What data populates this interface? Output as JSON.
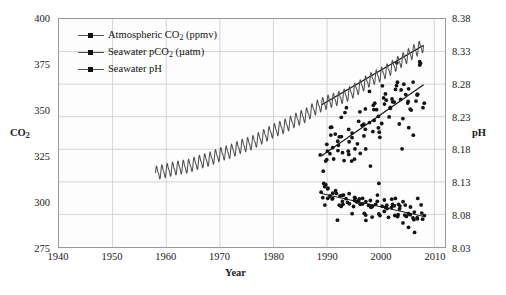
{
  "chart_data": {
    "type": "line",
    "title": "",
    "xlabel": "Year",
    "ylabel": "CO2",
    "ylabel_right": "pH",
    "xlim": [
      1940,
      2012
    ],
    "ylim": [
      275,
      400
    ],
    "ylim_right": [
      8.03,
      8.38
    ],
    "grid": true,
    "legend_position": "top-left",
    "x_ticks": [
      1940,
      1950,
      1960,
      1970,
      1980,
      1990,
      2000,
      2010
    ],
    "y_ticks_left": [
      275,
      300,
      325,
      350,
      375,
      400
    ],
    "y_ticks_right": [
      8.03,
      8.08,
      8.13,
      8.18,
      8.23,
      8.28,
      8.33,
      8.38
    ],
    "series": [
      {
        "name": "Atmospheric CO2 (ppmv)",
        "axis": "left",
        "style": "sawtooth-line",
        "units": "ppmv",
        "x_start": 1958,
        "x_end": 2008,
        "y_start": 316,
        "y_end": 385,
        "seasonal_amplitude": 3.2,
        "seasonal_period_years": 1,
        "values": [
          [
            1958,
            315.5
          ],
          [
            1960,
            316.9
          ],
          [
            1962,
            318.4
          ],
          [
            1964,
            319.2
          ],
          [
            1966,
            321.4
          ],
          [
            1968,
            323.1
          ],
          [
            1970,
            325.7
          ],
          [
            1972,
            327.4
          ],
          [
            1974,
            330.2
          ],
          [
            1976,
            332.1
          ],
          [
            1978,
            335.4
          ],
          [
            1980,
            338.7
          ],
          [
            1982,
            341.1
          ],
          [
            1984,
            344.4
          ],
          [
            1986,
            347.2
          ],
          [
            1988,
            351.6
          ],
          [
            1990,
            354.4
          ],
          [
            1992,
            356.4
          ],
          [
            1994,
            358.8
          ],
          [
            1996,
            362.6
          ],
          [
            1998,
            366.7
          ],
          [
            2000,
            369.5
          ],
          [
            2002,
            373.2
          ],
          [
            2004,
            377.5
          ],
          [
            2006,
            381.9
          ],
          [
            2008,
            385.6
          ]
        ]
      },
      {
        "name": "Seawater pCO2 (µatm)",
        "axis": "left",
        "style": "scatter-with-trend",
        "units": "µatm",
        "x_start": 1989,
        "x_end": 2008,
        "trend_y_start": 325,
        "trend_y_end": 364,
        "scatter_spread": 26
      },
      {
        "name": "Seawater pH",
        "axis": "right",
        "style": "scatter-with-trend",
        "units": "pH",
        "x_start": 1989,
        "x_end": 2008,
        "trend_y_start": 8.112,
        "trend_y_end": 8.077,
        "scatter_spread": 0.035
      }
    ]
  },
  "legend": {
    "items": [
      {
        "label_main": "Atmospheric CO",
        "label_sub": "2",
        "label_tail": " (ppmv)"
      },
      {
        "label_main": "Seawater pCO",
        "label_sub": "2",
        "label_tail": " (µatm)"
      },
      {
        "label_main": "Seawater pH",
        "label_sub": "",
        "label_tail": ""
      }
    ]
  },
  "axes": {
    "left_title_main": "CO",
    "left_title_sub": "2",
    "right_title": "pH",
    "bottom_title": "Year",
    "left_ticks": [
      "400",
      "375",
      "350",
      "325",
      "300",
      "275"
    ],
    "right_ticks": [
      "8.38",
      "8.33",
      "8.28",
      "8.23",
      "8.18",
      "8.13",
      "8.08",
      "8.03"
    ],
    "bottom_ticks": [
      "1940",
      "1950",
      "1960",
      "1970",
      "1980",
      "1990",
      "2000",
      "2010"
    ]
  },
  "colors": {
    "frame": "#9a9a9a",
    "grid": "#c9c9c9",
    "plot_bg": "#fdfdfd",
    "data_dark": "#141414",
    "data_mid": "#4f4f4f",
    "text": "#1a1a1a"
  },
  "artifact": {
    "text": ""
  }
}
